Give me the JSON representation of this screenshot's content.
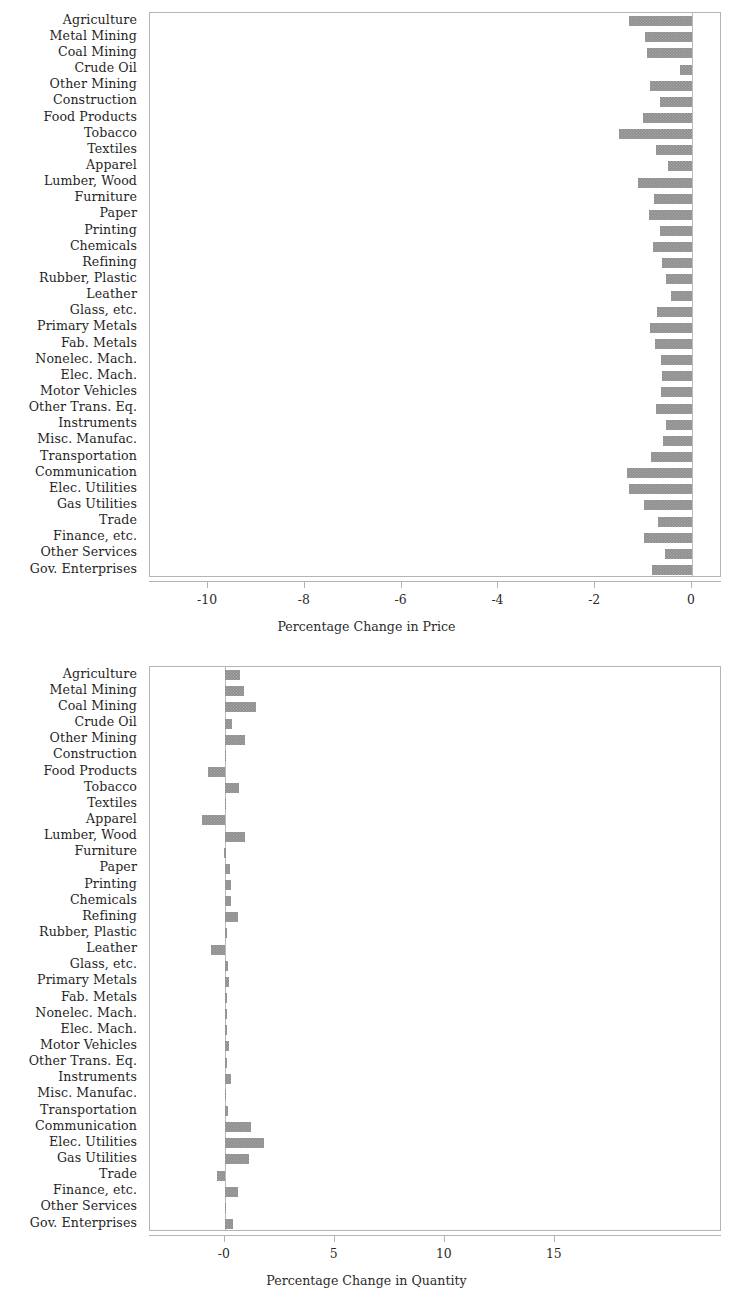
{
  "figure": {
    "background": "#ffffff",
    "bar_color": "#8e8e8e",
    "frame_color": "#b4b4b4",
    "text_color": "#2b2b2b"
  },
  "categories": [
    "Agriculture",
    "Metal Mining",
    "Coal Mining",
    "Crude Oil",
    "Other Mining",
    "Construction",
    "Food Products",
    "Tobacco",
    "Textiles",
    "Apparel",
    "Lumber, Wood",
    "Furniture",
    "Paper",
    "Printing",
    "Chemicals",
    "Refining",
    "Rubber, Plastic",
    "Leather",
    "Glass, etc.",
    "Primary Metals",
    "Fab. Metals",
    "Nonelec. Mach.",
    "Elec. Mach.",
    "Motor Vehicles",
    "Other Trans. Eq.",
    "Instruments",
    "Misc. Manufac.",
    "Transportation",
    "Communication",
    "Elec. Utilities",
    "Gas Utilities",
    "Trade",
    "Finance, etc.",
    "Other Services",
    "Gov. Enterprises"
  ],
  "chart_data": [
    {
      "type": "bar",
      "orientation": "horizontal",
      "title": "",
      "xlabel": "Percentage Change in Price",
      "ylabel": "",
      "xlim": [
        -11.2,
        0.62
      ],
      "xticks": [
        -10,
        -8,
        -6,
        -4,
        -2,
        0
      ],
      "xticklabels": [
        "-10",
        "-8",
        "-6",
        "-4",
        "-2",
        "0"
      ],
      "grid": false,
      "legend": null,
      "categories": [
        "Agriculture",
        "Metal Mining",
        "Coal Mining",
        "Crude Oil",
        "Other Mining",
        "Construction",
        "Food Products",
        "Tobacco",
        "Textiles",
        "Apparel",
        "Lumber, Wood",
        "Furniture",
        "Paper",
        "Printing",
        "Chemicals",
        "Refining",
        "Rubber, Plastic",
        "Leather",
        "Glass, etc.",
        "Primary Metals",
        "Fab. Metals",
        "Nonelec. Mach.",
        "Elec. Mach.",
        "Motor Vehicles",
        "Other Trans. Eq.",
        "Instruments",
        "Misc. Manufac.",
        "Transportation",
        "Communication",
        "Elec. Utilities",
        "Gas Utilities",
        "Trade",
        "Finance, etc.",
        "Other Services",
        "Gov. Enterprises"
      ],
      "values": [
        -1.31,
        -0.97,
        -0.93,
        -0.24,
        -0.87,
        -0.66,
        -1.01,
        -1.5,
        -0.74,
        -0.49,
        -1.11,
        -0.78,
        -0.88,
        -0.66,
        -0.8,
        -0.62,
        -0.54,
        -0.43,
        -0.72,
        -0.86,
        -0.76,
        -0.64,
        -0.62,
        -0.65,
        -0.74,
        -0.53,
        -0.6,
        -0.84,
        -1.35,
        -1.31,
        -0.99,
        -0.71,
        -0.99,
        -0.55,
        -0.82
      ]
    },
    {
      "type": "bar",
      "orientation": "horizontal",
      "title": "",
      "xlabel": "Percentage Change in Quantity",
      "ylabel": "",
      "xlim": [
        -3.4,
        22.6
      ],
      "xticks": [
        0,
        5,
        10,
        15
      ],
      "xticklabels": [
        "-0",
        "5",
        "10",
        "15"
      ],
      "grid": false,
      "legend": null,
      "categories": [
        "Agriculture",
        "Metal Mining",
        "Coal Mining",
        "Crude Oil",
        "Other Mining",
        "Construction",
        "Food Products",
        "Tobacco",
        "Textiles",
        "Apparel",
        "Lumber, Wood",
        "Furniture",
        "Paper",
        "Printing",
        "Chemicals",
        "Refining",
        "Rubber, Plastic",
        "Leather",
        "Glass, etc.",
        "Primary Metals",
        "Fab. Metals",
        "Nonelec. Mach.",
        "Elec. Mach.",
        "Motor Vehicles",
        "Other Trans. Eq.",
        "Instruments",
        "Misc. Manufac.",
        "Transportation",
        "Communication",
        "Elec. Utilities",
        "Gas Utilities",
        "Trade",
        "Finance, etc.",
        "Other Services",
        "Gov. Enterprises"
      ],
      "values": [
        0.7,
        0.88,
        1.4,
        0.32,
        0.94,
        0.06,
        -0.78,
        0.66,
        0.04,
        -1.02,
        0.9,
        -0.02,
        0.24,
        0.3,
        0.26,
        0.62,
        0.1,
        -0.62,
        0.16,
        0.2,
        0.1,
        0.12,
        0.12,
        0.18,
        0.1,
        0.26,
        0.06,
        0.14,
        1.18,
        1.78,
        1.1,
        -0.34,
        0.62,
        0.02,
        0.38
      ]
    }
  ]
}
